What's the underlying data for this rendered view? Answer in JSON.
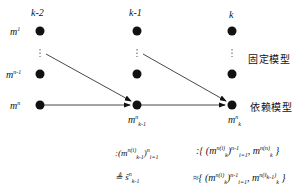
{
  "columns": [
    {
      "label": "k-2",
      "x": 40
    },
    {
      "label": "k-1",
      "x": 137
    },
    {
      "label": "k",
      "x": 232
    }
  ],
  "rows": [
    {
      "label": "m",
      "sup": "1",
      "y": 31
    },
    {
      "label": "m",
      "sup": "n-1",
      "y": 74
    },
    {
      "label": "m",
      "sup": "n",
      "y": 105
    }
  ],
  "side_labels": {
    "fixed": "固定模型",
    "dependent": "依赖模型"
  },
  "node_labels": {
    "mid": {
      "base": "m",
      "sup": "n",
      "sub": "k-1"
    },
    "right": {
      "base": "m",
      "sup": "n",
      "sub": "k"
    }
  },
  "formulas": {
    "left_1": ":(m_{k-1}^{n(i)})_{i=1}^{n}",
    "left_2": "≜ ŝ_{k-1}^{n}",
    "right_1": ":{(m_k^{n(i)})_{i=1}^{n-1}, m_k^{n(n)}}",
    "right_2": "≈{(m_k^{n(i)})_{i=1}^{n-1}, m_k^{n(ŝ_{k-1}^n)}}"
  }
}
